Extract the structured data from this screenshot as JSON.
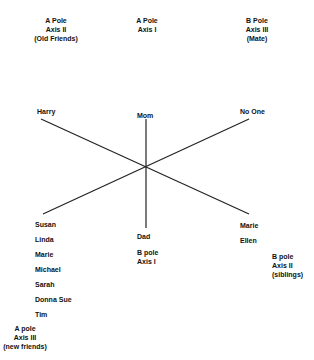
{
  "poles": {
    "a_axis2": [
      "A Pole",
      "Axis II",
      "(Old Friends)"
    ],
    "a_axis1": [
      "A Pole",
      "Axis I"
    ],
    "b_axis3": [
      "B Pole",
      "Axis III",
      "(Mate)"
    ],
    "b_axis1": [
      "B pole",
      "Axis I"
    ],
    "b_axis2": [
      "B pole",
      "Axis II",
      "(siblings)"
    ],
    "a_axis3": [
      "A pole",
      "Axis III",
      "(new friends)"
    ]
  },
  "endpoints": {
    "harry": "Harry",
    "mom": "Mom",
    "no_one": "No One",
    "dad": "Dad",
    "bottom_left": [
      "Susan",
      "Linda",
      "Marie",
      "Michael",
      "Sarah",
      "Donna Sue",
      "Tim"
    ],
    "bottom_right": [
      "Marie",
      "Ellen"
    ]
  },
  "colors": {
    "line": "#222222",
    "text": "#111111"
  }
}
